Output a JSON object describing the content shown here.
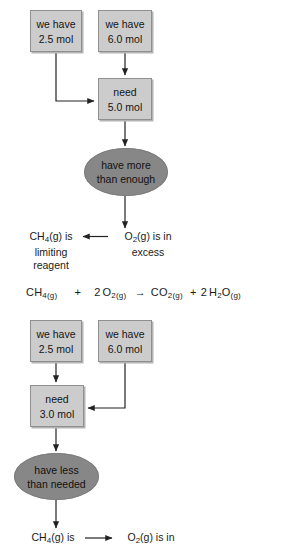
{
  "diagram": {
    "colors": {
      "box_fill": "#cccccc",
      "box_border": "#8f8f8f",
      "ellipse_fill": "#878787",
      "line": "#222222",
      "text": "#1a1a1a",
      "background": "#ffffff"
    },
    "top_case": {
      "have_left": {
        "line1": "we have",
        "line2": "2.5 mol"
      },
      "have_right": {
        "line1": "we have",
        "line2": "6.0 mol"
      },
      "need": {
        "line1": "need",
        "line2": "5.0 mol"
      },
      "verdict": {
        "line1": "have more",
        "line2": "than enough"
      },
      "conclusion_left": {
        "line1": "CH",
        "sub1": "4",
        "line1b": "(g) is",
        "line2": "limiting",
        "line3": "reagent"
      },
      "conclusion_right": {
        "line1": "O",
        "sub1": "2",
        "line1b": "(g) is in",
        "line2": "excess"
      }
    },
    "equation": {
      "reactant1": {
        "formula": "CH",
        "sub": "4",
        "state": "(g)"
      },
      "plus1": "+",
      "coefficient2": "2",
      "reactant2": {
        "formula": "O",
        "sub": "2",
        "state": "(g)"
      },
      "arrow": "→",
      "product1": {
        "formula": "CO",
        "sub": "2",
        "state": "(g)"
      },
      "plus2": "+",
      "coefficient4": "2",
      "product2": {
        "formula": "H",
        "sub": "2",
        "formula_b": "O",
        "state": "(g)"
      }
    },
    "bottom_case": {
      "have_left": {
        "line1": "we have",
        "line2": "2.5 mol"
      },
      "have_right": {
        "line1": "we have",
        "line2": "6.0 mol"
      },
      "need": {
        "line1": "need",
        "line2": "3.0 mol"
      },
      "verdict": {
        "line1": "have less",
        "line2": "than needed"
      },
      "conclusion_left": {
        "line1": "CH",
        "sub1": "4",
        "line1b": "(g) is"
      },
      "conclusion_right": {
        "line1": "O",
        "sub1": "2",
        "line1b": "(g) is in"
      }
    }
  }
}
